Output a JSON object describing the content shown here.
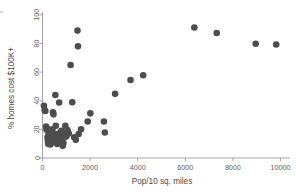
{
  "figure": {
    "background_color": "#ffffff",
    "point_color": "#4d4d4d",
    "axis_color": "#9a9a9a",
    "text_color": "#4a4a4a"
  },
  "chart_data": {
    "type": "scatter",
    "title": "",
    "subtitle": "",
    "xlabel": "Pop/10 sq. miles",
    "ylabel": "% homes cost $100K+",
    "xlim": [
      0,
      10400
    ],
    "ylim": [
      0,
      102
    ],
    "xticks": [
      0,
      2000,
      4000,
      6000,
      8000,
      10000
    ],
    "xticklabels": [
      "0",
      "2000",
      "4000",
      "6000",
      "8000",
      "10000"
    ],
    "yticks": [
      0,
      20,
      40,
      60,
      80,
      100
    ],
    "yticklabels": [
      "0",
      "20",
      "40",
      "60",
      "80",
      "100"
    ],
    "grid": false,
    "legend": null,
    "marker": "circle",
    "marker_size": 4.6,
    "series": [
      {
        "name": "counties",
        "color": "#4d4d4d",
        "points": [
          [
            60,
            36.5
          ],
          [
            90,
            33.5
          ],
          [
            120,
            32.8
          ],
          [
            150,
            22.0
          ],
          [
            170,
            19.8
          ],
          [
            190,
            20.5
          ],
          [
            210,
            14.5
          ],
          [
            225,
            12.0
          ],
          [
            240,
            10.0
          ],
          [
            250,
            16.0
          ],
          [
            265,
            13.5
          ],
          [
            280,
            18.5
          ],
          [
            300,
            15.0
          ],
          [
            315,
            11.5
          ],
          [
            330,
            9.5
          ],
          [
            345,
            13.0
          ],
          [
            360,
            17.5
          ],
          [
            380,
            14.0
          ],
          [
            400,
            12.2
          ],
          [
            420,
            20.0
          ],
          [
            440,
            32.0
          ],
          [
            460,
            30.5
          ],
          [
            480,
            15.5
          ],
          [
            500,
            11.0
          ],
          [
            520,
            13.8
          ],
          [
            540,
            44.0
          ],
          [
            560,
            22.5
          ],
          [
            580,
            16.5
          ],
          [
            600,
            12.8
          ],
          [
            620,
            9.8
          ],
          [
            650,
            14.2
          ],
          [
            680,
            17.0
          ],
          [
            700,
            38.8
          ],
          [
            720,
            13.0
          ],
          [
            740,
            11.8
          ],
          [
            760,
            15.5
          ],
          [
            790,
            19.0
          ],
          [
            820,
            13.5
          ],
          [
            850,
            8.5
          ],
          [
            880,
            10.5
          ],
          [
            900,
            16.8
          ],
          [
            930,
            14.8
          ],
          [
            960,
            22.5
          ],
          [
            1000,
            15.0
          ],
          [
            1050,
            19.5
          ],
          [
            1100,
            17.2
          ],
          [
            1180,
            65.0
          ],
          [
            1250,
            39.0
          ],
          [
            1330,
            14.5
          ],
          [
            1400,
            12.8
          ],
          [
            1470,
            89.0
          ],
          [
            1490,
            78.0
          ],
          [
            1520,
            16.8
          ],
          [
            1620,
            20.0
          ],
          [
            1900,
            25.5
          ],
          [
            2010,
            31.2
          ],
          [
            2580,
            25.5
          ],
          [
            2620,
            17.8
          ],
          [
            3050,
            44.8
          ],
          [
            3700,
            54.5
          ],
          [
            4230,
            57.8
          ],
          [
            6380,
            91.2
          ],
          [
            7320,
            87.3
          ],
          [
            8960,
            79.8
          ],
          [
            9820,
            79.3
          ]
        ]
      }
    ]
  }
}
